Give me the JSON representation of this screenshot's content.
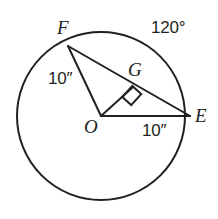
{
  "figure": {
    "type": "geometry-diagram",
    "canvas": {
      "width": 218,
      "height": 219,
      "background": "#ffffff"
    },
    "stroke_color": "#231f20",
    "text_color": "#231f20",
    "circle": {
      "name": "circle-O",
      "center": {
        "x": 101,
        "y": 116
      },
      "radius": 84,
      "stroke_width": 2
    },
    "points": [
      {
        "id": "F",
        "label": "F",
        "x": 68,
        "y": 46,
        "on": "circle"
      },
      {
        "id": "E",
        "label": "E",
        "x": 190,
        "y": 116,
        "on": "circle"
      },
      {
        "id": "O",
        "label": "O",
        "x": 101,
        "y": 116,
        "on": "center"
      },
      {
        "id": "G",
        "label": "G",
        "x": 133,
        "y": 87,
        "on": "chord-FE"
      }
    ],
    "segments": [
      {
        "id": "OF",
        "from": "O",
        "to": "F",
        "name": "radius-of"
      },
      {
        "id": "OE",
        "from": "O",
        "to": "E",
        "name": "radius-oe"
      },
      {
        "id": "FE",
        "from": "F",
        "to": "E",
        "name": "chord-fe"
      },
      {
        "id": "OG",
        "from": "O",
        "to": "G",
        "name": "perpendicular-og"
      }
    ],
    "right_angle": {
      "at": "G",
      "name": "right-angle-mark-at-g",
      "size": 14
    },
    "labels": {
      "point_F": "F",
      "point_G": "G",
      "point_E": "E",
      "point_O": "O",
      "arc_angle": "120°",
      "radius_of_measure": "10″",
      "radius_oe_measure": "10″"
    }
  }
}
